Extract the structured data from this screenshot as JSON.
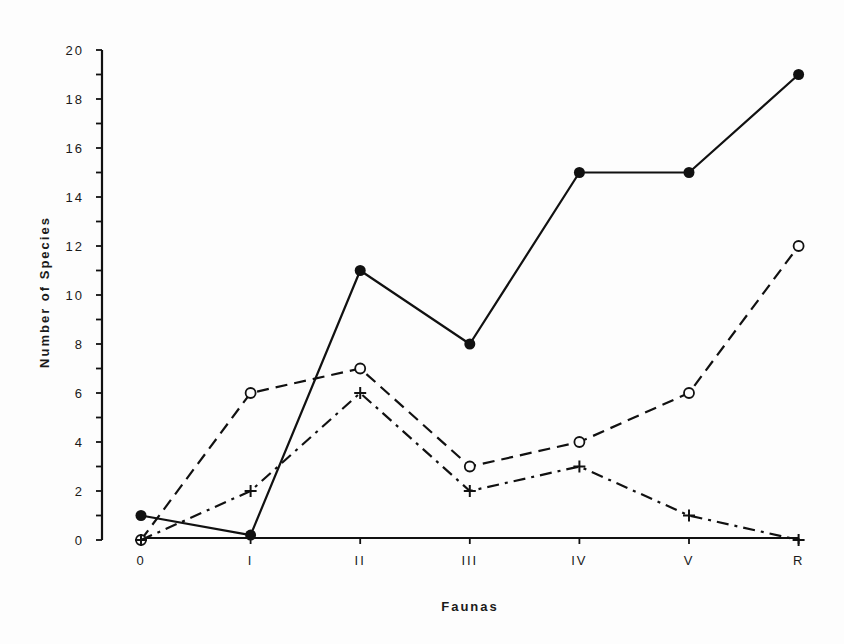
{
  "chart_data": {
    "type": "line",
    "title": "",
    "xlabel": "Faunas",
    "ylabel": "Number of Species",
    "categories": [
      "0",
      "I",
      "II",
      "III",
      "IV",
      "V",
      "R"
    ],
    "ylim": [
      0,
      20
    ],
    "yticks": [
      0,
      2,
      4,
      6,
      8,
      10,
      12,
      14,
      16,
      18,
      20
    ],
    "yminor_step": 1,
    "grid": false,
    "legend": null,
    "series": [
      {
        "name": "filled-circle-solid",
        "marker": "filled-circle",
        "linestyle": "solid",
        "values": [
          1,
          0.2,
          11,
          8,
          15,
          15,
          19
        ]
      },
      {
        "name": "open-circle-dashed",
        "marker": "open-circle",
        "linestyle": "dashed",
        "values": [
          0,
          6,
          7,
          3,
          4,
          6,
          12
        ]
      },
      {
        "name": "cross-dashdot",
        "marker": "cross",
        "linestyle": "dashdot",
        "values": [
          0,
          2,
          6,
          2,
          3,
          1,
          0
        ]
      }
    ]
  }
}
